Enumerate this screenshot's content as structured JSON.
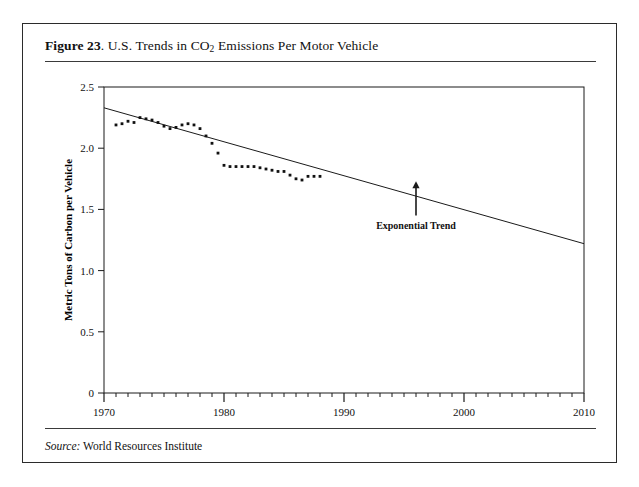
{
  "figure": {
    "number_label": "Figure 23",
    "separator": ".",
    "title_pre": "U.S. Trends in CO",
    "title_sub": "2",
    "title_post": " Emissions Per Motor Vehicle",
    "source_label": "Source:",
    "source_value": "World Resources Institute"
  },
  "chart_data": {
    "type": "scatter",
    "title": "U.S. Trends in CO2 Emissions Per Motor Vehicle",
    "xlabel": "",
    "ylabel": "Metric Tons of Carbon per Vehicle",
    "xlim": [
      1970,
      2010
    ],
    "ylim": [
      0,
      2.5
    ],
    "x_major_ticks": [
      1970,
      1980,
      1990,
      2000,
      2010
    ],
    "x_major_tick_labels": [
      "1970",
      "1980",
      "1990",
      "2000",
      "2010"
    ],
    "x_minor_tick_step": 1,
    "y_ticks": [
      0,
      0.5,
      1.0,
      1.5,
      2.0,
      2.5
    ],
    "y_tick_labels": [
      "0",
      "0.5",
      "1.0",
      "1.5",
      "2.0",
      "2.5"
    ],
    "grid": false,
    "legend": null,
    "series": [
      {
        "name": "CO2 Emissions Per Motor Vehicle",
        "marker": "dot",
        "color": "#111111",
        "x": [
          1971,
          1971.5,
          1972,
          1972.5,
          1973,
          1973.5,
          1974,
          1974.5,
          1975,
          1975.5,
          1976,
          1976.5,
          1977,
          1977.5,
          1978,
          1978.5,
          1979,
          1979.5,
          1980,
          1980.5,
          1981,
          1981.5,
          1982,
          1982.5,
          1983,
          1983.5,
          1984,
          1984.5,
          1985,
          1985.5,
          1986,
          1986.5,
          1987,
          1987.5,
          1988
        ],
        "y": [
          2.19,
          2.2,
          2.22,
          2.21,
          2.25,
          2.24,
          2.23,
          2.21,
          2.18,
          2.16,
          2.17,
          2.19,
          2.2,
          2.19,
          2.16,
          2.1,
          2.04,
          1.96,
          1.86,
          1.85,
          1.85,
          1.85,
          1.85,
          1.85,
          1.84,
          1.83,
          1.82,
          1.81,
          1.81,
          1.78,
          1.75,
          1.74,
          1.77,
          1.77,
          1.77
        ]
      }
    ],
    "trendline": {
      "name": "Exponential Trend",
      "annotation": "Exponential Trend",
      "x_start": 1970,
      "y_start": 2.33,
      "x_end": 2010,
      "y_end": 1.22,
      "arrow_x": 1996,
      "arrow_from_y": 1.45,
      "arrow_to_y": 1.73
    }
  }
}
